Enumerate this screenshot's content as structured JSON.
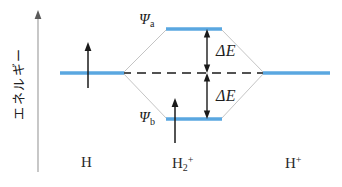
{
  "figure": {
    "type": "molecular-orbital-energy-level-diagram",
    "background_color": "#ffffff",
    "axis": {
      "title": "エネルギー",
      "orientation": "vertical",
      "arrow_direction": "up",
      "line_color": "#9a9a9a"
    },
    "colors": {
      "level_blue": "#5aa7e0",
      "correlation_gray": "#b8b8b8",
      "dashed_black": "#1a1a1a",
      "arrow_black": "#1a1a1a",
      "text": "#1d1d1d"
    },
    "levels": [
      {
        "name": "hydrogen-atom-level",
        "label": "H",
        "column": "left",
        "energy": "reference",
        "electrons": 1,
        "electron_spin": "up"
      },
      {
        "name": "antibonding-level",
        "label": "Ψ",
        "sublabel": "a",
        "column": "center",
        "energy": "reference + ΔE",
        "electrons": 0
      },
      {
        "name": "bonding-level",
        "label": "Ψ",
        "sublabel": "b",
        "column": "center",
        "energy": "reference - ΔE",
        "electrons": 1,
        "electron_spin": "up"
      },
      {
        "name": "proton-level",
        "label": "H",
        "sup": "+",
        "column": "right",
        "energy": "reference",
        "electrons": 0
      }
    ],
    "annotations": [
      {
        "name": "delta-e-upper",
        "text": "ΔE",
        "meaning": "antibonding destabilization energy"
      },
      {
        "name": "delta-e-lower",
        "text": "ΔE",
        "meaning": "bonding stabilization energy"
      }
    ],
    "orbital_labels": {
      "antibonding": {
        "symbol": "Ψ",
        "subscript": "a"
      },
      "bonding": {
        "symbol": "Ψ",
        "subscript": "b"
      }
    },
    "delta_e": {
      "upper": "ΔE",
      "lower": "ΔE"
    },
    "species": [
      {
        "name": "species-h",
        "base": "H",
        "sub": "",
        "sup": ""
      },
      {
        "name": "species-h2-cation",
        "base": "H",
        "sub": "2",
        "sup": "+"
      },
      {
        "name": "species-h-cation",
        "base": "H",
        "sub": "",
        "sup": "+"
      }
    ]
  }
}
